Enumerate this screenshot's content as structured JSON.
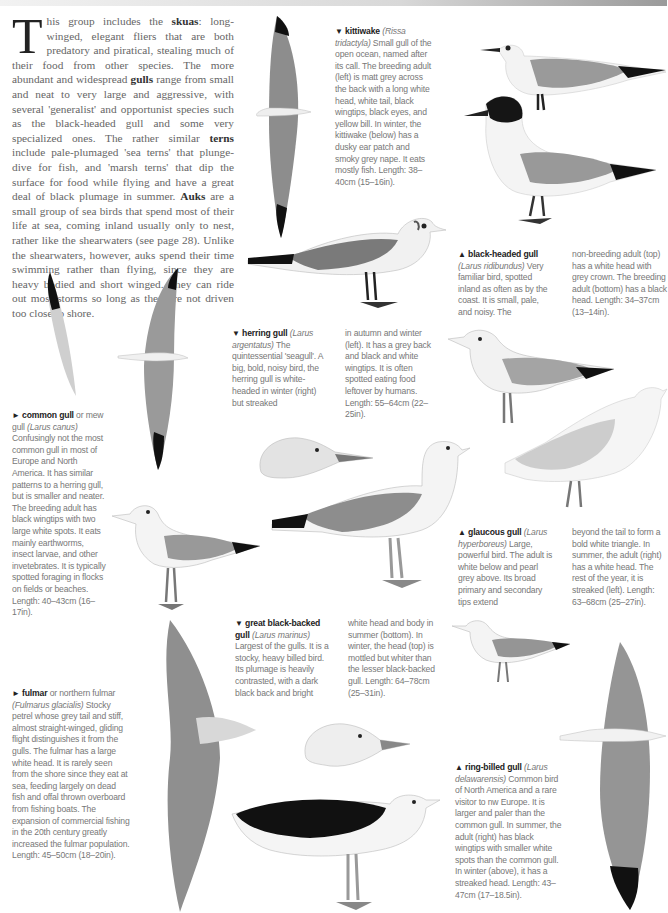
{
  "page": {
    "intro": {
      "dropcap": "T",
      "segments": [
        {
          "t": "his group includes the ",
          "b": false
        },
        {
          "t": "skuas",
          "b": true
        },
        {
          "t": ": long-winged, elegant fliers that are both predatory and piratical, stealing much of their food from other species. The more abundant and widespread ",
          "b": false
        },
        {
          "t": "gulls",
          "b": true
        },
        {
          "t": " range from small and neat to very large and aggressive, with several 'generalist' and opportunist species such as the black-headed gull and some very specialized ones. The rather similar ",
          "b": false
        },
        {
          "t": "terns",
          "b": true
        },
        {
          "t": " include pale-plumaged 'sea terns' that plunge-dive for fish, and 'marsh terns' that dip the surface for food while flying and have a great deal of black plumage in summer. ",
          "b": false
        },
        {
          "t": "Auks",
          "b": true
        },
        {
          "t": " are a small group of sea birds that spend most of their life at sea, coming inland usually only to nest, rather like the shearwaters (see page 28). Unlike the shearwaters, however, auks spend their time swimming rather than flying, since they are heavy bodied and short winged. They can ride out most storms so long as they are not driven too close to shore.",
          "b": false
        }
      ]
    },
    "captions": {
      "kittiwake": {
        "arrow": "▼",
        "name": "kittiwake",
        "latin": "(Rissa tridactyla)",
        "text": " Small gull of the open ocean, named after its call. The breeding adult (left) is matt grey across the back with a long white head, white tail, black wingtips, black eyes, and yellow bill. In winter, the kittiwake (below) has a dusky ear patch and smoky grey nape. It eats mostly fish. Length: 38–40cm (15–16in)."
      },
      "black_headed_gull": {
        "arrow": "▲",
        "name": "black-headed gull",
        "latin": "(Larus ridibundus)",
        "text": " Very familiar bird, spotted inland as often as by the coast. It is small, pale, and noisy. The",
        "text2": "non-breeding adult (top) has a white head with grey crown. The breeding adult (bottom) has a black head. Length: 34–37cm (13–14in)."
      },
      "common_gull": {
        "arrow": "►",
        "name": "common gull",
        "pre_latin": " or mew gull ",
        "latin": "(Larus canus)",
        "text": " Confusingly not the most common gull in most of Europe and North America. It has similar patterns to a herring gull, but is smaller and neater. The breeding adult has black wingtips with two large white spots. It eats mainly earthworms, insect larvae, and other invetebrates. It is typically spotted foraging in flocks on fields or beaches. Length: 40–43cm (16–17in)."
      },
      "herring_gull": {
        "arrow": "▼",
        "name": "herring gull",
        "latin": "(Larus argentatus)",
        "text": " The quintessential 'seagull'. A big, bold, noisy bird, the herring gull is white-headed in winter (right) but streaked",
        "text2": "in autumn and winter (left). It has a grey back and black and white wingtips. It is often spotted eating food leftover by humans. Length: 55–64cm (22–25in)."
      },
      "glaucous_gull": {
        "arrow": "▲",
        "name": "glaucous gull",
        "latin": "(Larus hyperboreus)",
        "text": " Large, powerful bird. The adult is white below and pearl grey above. Its broad primary and secondary tips extend",
        "text2": "beyond the tail to form a bold white triangle. In summer, the adult (right) has a white head. The rest of the year, it is streaked (left). Length: 63–68cm (25–27in)."
      },
      "fulmar": {
        "arrow": "►",
        "name": "fulmar",
        "pre_latin": " or northern fulmar ",
        "latin": "(Fulmarus glacialis)",
        "text": " Stocky petrel whose grey tail and stiff, almost straight-winged, gliding flight distinguishes it from the gulls. The fulmar has a large white head. It is rarely seen from the shore since they eat at sea, feeding largely on dead fish and offal thrown overboard from fishing boats. The expansion of commercial fishing in the 20th century greatly increased the fulmar population. Length: 45–50cm (18–20in)."
      },
      "great_black_backed_gull": {
        "arrow": "▼",
        "name": "great black-backed gull",
        "latin": "(Larus marinus)",
        "text": " Largest of the gulls. It is a stocky, heavy billed bird. Its plumage is heavily contrasted, with a dark black back and bright",
        "text2": "white head and body in summer (bottom). In winter, the head (top) is mottled but whiter than the lesser black-backed gull. Length: 64–78cm (25–31in)."
      },
      "ring_billed_gull": {
        "arrow": "▲",
        "name": "ring-billed gull",
        "latin": "(Larus delawarensis)",
        "text": " Common bird of North America and a rare visitor to nw Europe. It is larger and paler than the common gull. In summer, the adult (right) has black wingtips with smaller white spots than the common gull. In winter (above), it has a streaked head. Length: 43–47cm (17–18.5in)."
      }
    },
    "colors": {
      "wing_grey": "#8a8a8a",
      "back_grey": "#9b9b9b",
      "black": "#111111",
      "body_white": "#f4f4f4",
      "leg": "#555555"
    }
  }
}
